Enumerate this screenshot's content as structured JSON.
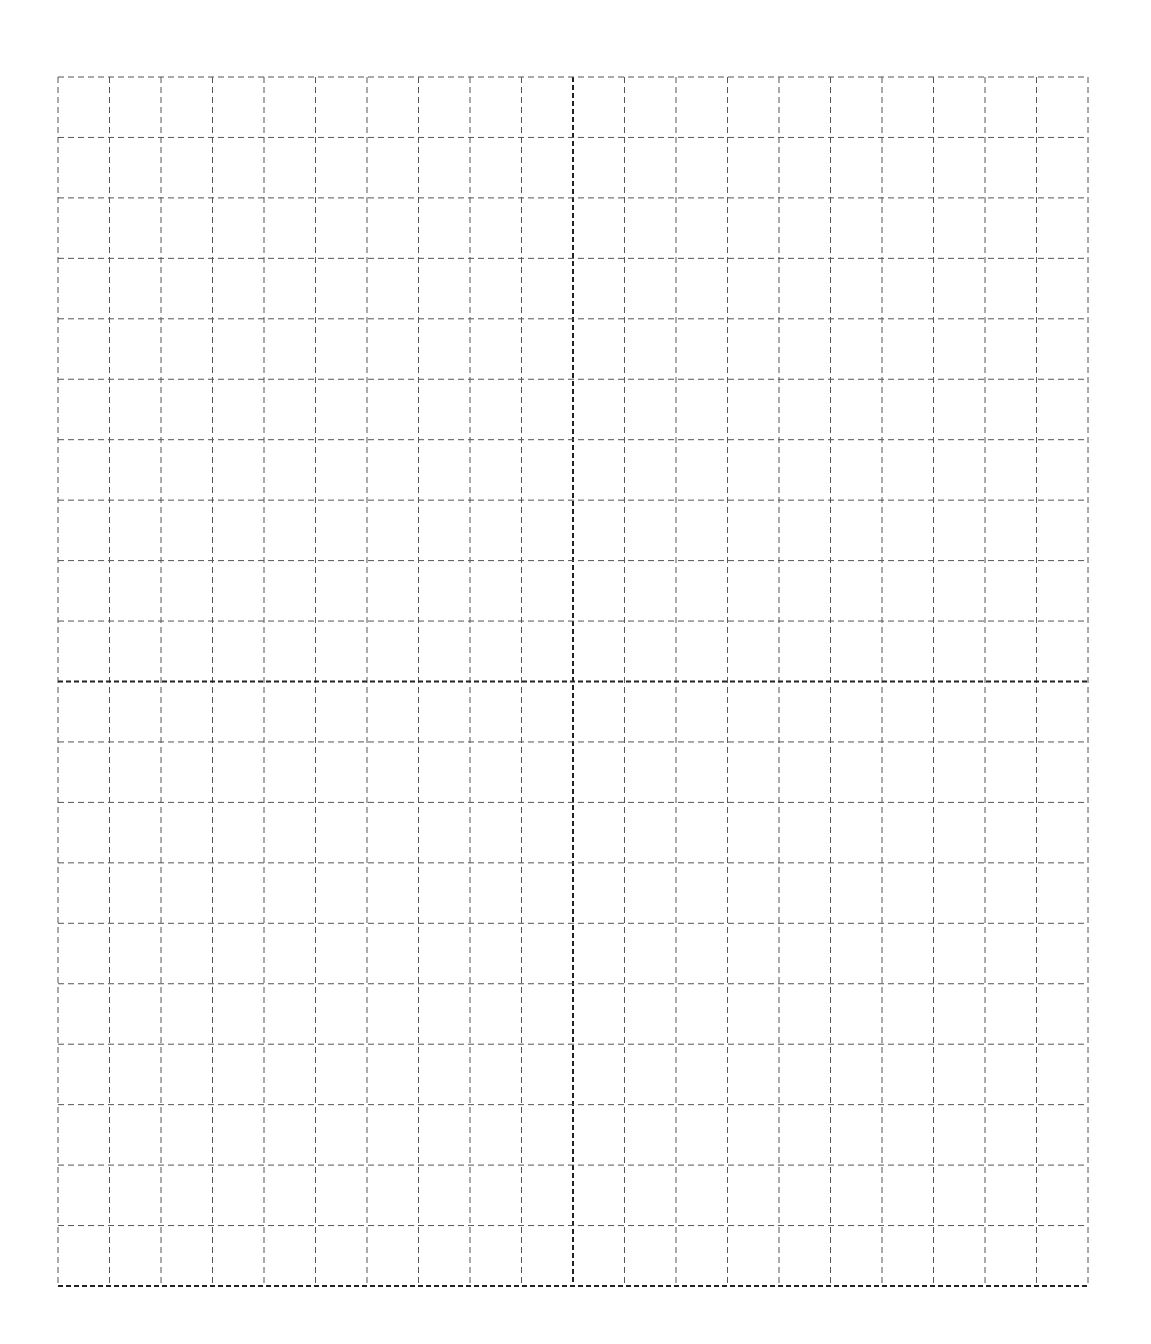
{
  "page": {
    "width": 1151,
    "height": 1344,
    "background": "#ffffff"
  },
  "grid": {
    "columns": 20,
    "rows": 20,
    "left": 58,
    "top": 77,
    "right": 1088,
    "bottom": 1286,
    "line_color": "#555555",
    "axis_color": "#222222",
    "line_width": 1,
    "axis_width": 2,
    "dash": "6,4",
    "axis_dash": "5,3",
    "axis_column_index": 10,
    "axis_row_index": 10,
    "border_bottom_bold": true
  }
}
